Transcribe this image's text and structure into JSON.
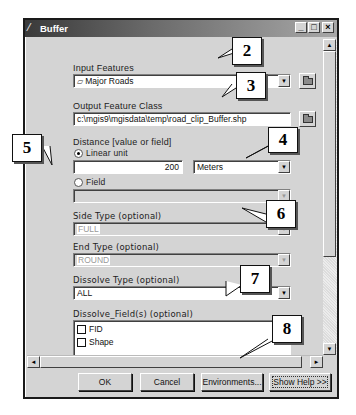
{
  "window": {
    "title": "Buffer",
    "controls": {
      "minimize": "_",
      "maximize": "□",
      "close": "×"
    }
  },
  "form": {
    "input_features": {
      "label": "Input Features",
      "value": "Major Roads",
      "icon": "polyline-layer-icon"
    },
    "output_feature_class": {
      "label": "Output Feature Class",
      "value": "c:\\mgis9\\mgisdata\\temp\\road_clip_Buffer.shp"
    },
    "distance": {
      "label": "Distance [value or field]",
      "linear_unit_label": "Linear unit",
      "linear_unit_checked": true,
      "value": "200",
      "unit": "Meters",
      "field_label": "Field",
      "field_checked": false,
      "field_value": ""
    },
    "side_type": {
      "label": "Side Type (optional)",
      "value": "FULL",
      "disabled": true
    },
    "end_type": {
      "label": "End Type (optional)",
      "value": "ROUND",
      "disabled": true
    },
    "dissolve_type": {
      "label": "Dissolve Type (optional)",
      "value": "ALL"
    },
    "dissolve_fields": {
      "label": "Dissolve_Field(s) (optional)",
      "items": [
        {
          "label": "FID",
          "checked": false
        },
        {
          "label": "Shape",
          "checked": false
        }
      ]
    }
  },
  "buttons": {
    "ok": "OK",
    "cancel": "Cancel",
    "environments": "Environments...",
    "show_help": "Show Help >>"
  },
  "callouts": [
    "2",
    "3",
    "4",
    "5",
    "6",
    "7",
    "8"
  ]
}
